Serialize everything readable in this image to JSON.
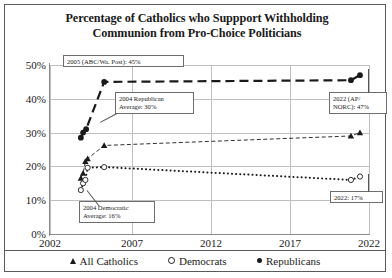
{
  "chart_data": {
    "type": "line",
    "title": "Percentage of Catholics who Suppport Withholding Communion from Pro-Choice Politicians",
    "title_line1": "Percentage of Catholics who Suppport Withholding",
    "title_line2": "Communion from Pro-Choice Politicians",
    "xlabel": "",
    "ylabel": "",
    "xlim": [
      2002,
      2023.2
    ],
    "ylim": [
      0,
      50
    ],
    "xticks": [
      "2002",
      "2007",
      "2012",
      "2017",
      "2022"
    ],
    "xtick_values": [
      2002,
      2007,
      2012,
      2017,
      2022
    ],
    "yticks": [
      "0%",
      "10%",
      "20%",
      "30%",
      "40%",
      "50%"
    ],
    "ytick_values": [
      0,
      10,
      20,
      30,
      40,
      50
    ],
    "grid": true,
    "legend_position": "bottom",
    "series": [
      {
        "name": "All Catholics",
        "marker": "triangle",
        "linestyle": "dashed-thin",
        "points": [
          {
            "x": 2004.05,
            "y": 16.5
          },
          {
            "x": 2004.2,
            "y": 18.0
          },
          {
            "x": 2004.35,
            "y": 21.5
          },
          {
            "x": 2004.5,
            "y": 22.3
          },
          {
            "x": 2005.6,
            "y": 26.2
          },
          {
            "x": 2022.0,
            "y": 29.0
          },
          {
            "x": 2022.6,
            "y": 30.0
          }
        ]
      },
      {
        "name": "Democrats",
        "marker": "open-circle",
        "linestyle": "dotted",
        "points": [
          {
            "x": 2004.05,
            "y": 13.0
          },
          {
            "x": 2004.2,
            "y": 15.0
          },
          {
            "x": 2004.35,
            "y": 16.0
          },
          {
            "x": 2004.5,
            "y": 19.6
          },
          {
            "x": 2005.6,
            "y": 19.8
          },
          {
            "x": 2022.0,
            "y": 16.0
          },
          {
            "x": 2022.6,
            "y": 17.0
          }
        ]
      },
      {
        "name": "Republicans",
        "marker": "filled-circle",
        "linestyle": "dashed-heavy",
        "points": [
          {
            "x": 2004.05,
            "y": 28.5
          },
          {
            "x": 2004.2,
            "y": 30.0
          },
          {
            "x": 2004.4,
            "y": 31.0
          },
          {
            "x": 2005.6,
            "y": 45.0
          },
          {
            "x": 2022.0,
            "y": 45.5
          },
          {
            "x": 2022.6,
            "y": 47.0
          }
        ]
      }
    ],
    "annotations": [
      {
        "id": "ann-2005-abc",
        "text": "2005 (ABC/Wa. Post): 45%"
      },
      {
        "id": "ann-2004-rep",
        "text": "2004 Republican\nAverage: 30%"
      },
      {
        "id": "ann-2004-dem",
        "text": "2004 Democratic\nAverage: 16%"
      },
      {
        "id": "ann-2022-ap",
        "text": "2022 (AP/\nNORC): 47%"
      },
      {
        "id": "ann-2022-dem",
        "text": "2022: 17%"
      }
    ]
  },
  "legend": {
    "items": [
      {
        "label": "All Catholics",
        "marker": "triangle-marker"
      },
      {
        "label": "Democrats",
        "marker": "open-circle-marker"
      },
      {
        "label": "Republicans",
        "marker": "filled-circle-marker"
      }
    ]
  },
  "colors": {
    "ink": "#1a1a1a",
    "grid": "#bfbfbf",
    "axis": "#8a8a8a",
    "border": "#5a5a5a",
    "background": "#ffffff"
  }
}
